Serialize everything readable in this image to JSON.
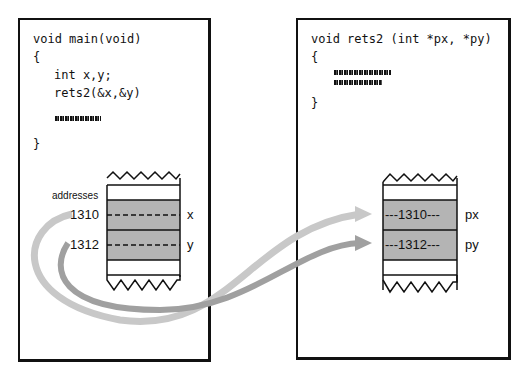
{
  "left_panel": {
    "code": [
      "void main(void)",
      "{",
      "int x,y;",
      "rets2(&x,&y)",
      "}"
    ],
    "addresses_label": "addresses",
    "addresses": [
      "1310",
      "1312"
    ],
    "vars": [
      "x",
      "y"
    ]
  },
  "right_panel": {
    "code": [
      "void rets2 (int *px, *py)",
      "{",
      "}"
    ],
    "cells": [
      "---1310---",
      "---1312---"
    ],
    "vars": [
      "px",
      "py"
    ]
  },
  "colors": {
    "cell_fill": "#b4b4b4",
    "arrow_light": "#c8c8c8",
    "arrow_dark": "#a0a0a0",
    "border": "#111111"
  }
}
